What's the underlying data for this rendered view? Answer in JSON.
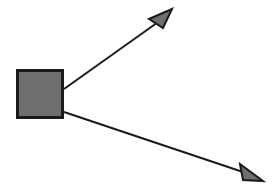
{
  "canvas": {
    "width": 278,
    "height": 194,
    "background_color": "#ffffff",
    "title": "Branching arrow diagram"
  },
  "style": {
    "stroke_color": "#1a1a1a",
    "fill_gray": "#6e6e6e",
    "square_border_color": "#1a1a1a",
    "square_border_width": 3,
    "line_width": 2,
    "arrowhead_outline_width": 2
  },
  "shapes": {
    "square": {
      "name": "source-node",
      "x": 16,
      "y": 69,
      "width": 48,
      "height": 50,
      "fill": "#6e6e6e",
      "stroke": "#1a1a1a",
      "stroke_width": 3
    },
    "arrows": [
      {
        "name": "upper-right-arrow",
        "direction": "up-right",
        "start_x": 64,
        "start_y": 89,
        "end_x": 164,
        "end_y": 17,
        "tip_x": 172,
        "tip_y": 9,
        "head_points": "172,9 149,19 163,28",
        "line_points": "64,89 161,20",
        "fill": "#6e6e6e",
        "stroke": "#1a1a1a"
      },
      {
        "name": "lower-right-arrow",
        "direction": "down-right",
        "start_x": 64,
        "start_y": 112,
        "end_x": 252,
        "end_y": 172,
        "tip_x": 263,
        "tip_y": 181,
        "head_points": "263,181 240,164 243,180",
        "line_points": "64,112 246,173",
        "fill": "#6e6e6e",
        "stroke": "#1a1a1a"
      }
    ]
  },
  "labels": {
    "square_label": "",
    "upper_arrow_label": "",
    "lower_arrow_label": ""
  }
}
